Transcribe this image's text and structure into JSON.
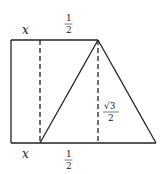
{
  "diagram": {
    "labels": {
      "top_x": "x",
      "top_half_num": "1",
      "top_half_den": "2",
      "bottom_x": "x",
      "bottom_half_num": "1",
      "bottom_half_den": "2",
      "height_num": "√3",
      "height_den": "2"
    },
    "colors": {
      "line": "#222222",
      "background": "#ffffff"
    }
  }
}
